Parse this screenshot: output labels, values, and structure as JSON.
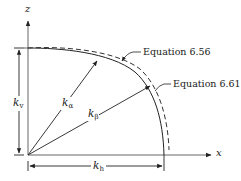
{
  "diagram": {
    "axes": {
      "vertical_label": "z",
      "horizontal_label": "x"
    },
    "curves": [
      {
        "name": "Equation 6.56",
        "style": "dashed"
      },
      {
        "name": "Equation 6.61",
        "style": "solid"
      }
    ],
    "labels": {
      "eq_656": "Equation 6.56",
      "eq_661": "Equation 6.61"
    },
    "vectors": [
      {
        "symbol": "k",
        "subscript": "α"
      },
      {
        "symbol": "k",
        "subscript": "β"
      }
    ],
    "dimensions": {
      "vertical": {
        "symbol": "k",
        "subscript": "v"
      },
      "horizontal": {
        "symbol": "k",
        "subscript": "h"
      }
    },
    "colors": {
      "line": "#222222",
      "axis": "#555555",
      "background": "#ffffff"
    }
  }
}
